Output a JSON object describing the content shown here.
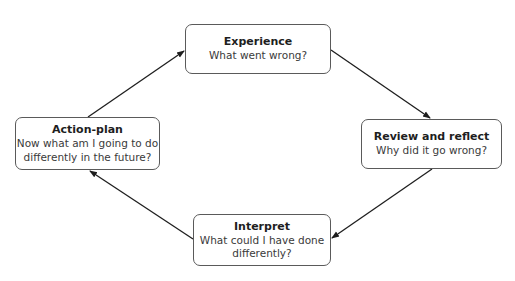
{
  "diagram": {
    "type": "cycle",
    "nodes": [
      {
        "id": "experience",
        "title": "Experience",
        "description": "What went wrong?"
      },
      {
        "id": "review",
        "title": "Review and reflect",
        "description": "Why did it go wrong?"
      },
      {
        "id": "interpret",
        "title": "Interpret",
        "description": "What could I have done differently?",
        "description_lines": [
          "What could I have done",
          "differently?"
        ]
      },
      {
        "id": "action",
        "title": "Action-plan",
        "description": "Now what am I going to do differently in the future?",
        "description_lines": [
          "Now what am I going to do",
          "differently in the future?"
        ]
      }
    ],
    "edges": [
      {
        "from": "experience",
        "to": "review"
      },
      {
        "from": "review",
        "to": "interpret"
      },
      {
        "from": "interpret",
        "to": "action"
      },
      {
        "from": "action",
        "to": "experience"
      }
    ]
  }
}
